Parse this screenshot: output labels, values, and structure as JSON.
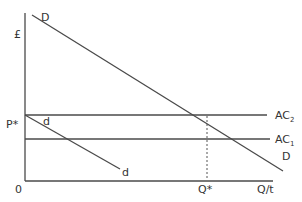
{
  "diagram": {
    "type": "economics-demand-cost",
    "axes": {
      "y_label": "£",
      "x_label": "Q/t",
      "origin_label": "0"
    },
    "curves": {
      "market_demand": {
        "label_start": "D",
        "label_end": "D"
      },
      "firm_demand": {
        "label_start": "d",
        "label_end": "d"
      },
      "ac2": {
        "label": "AC",
        "subscript": "2"
      },
      "ac1": {
        "label": "AC",
        "subscript": "1"
      }
    },
    "markers": {
      "price": "P*",
      "quantity": "Q*"
    }
  }
}
